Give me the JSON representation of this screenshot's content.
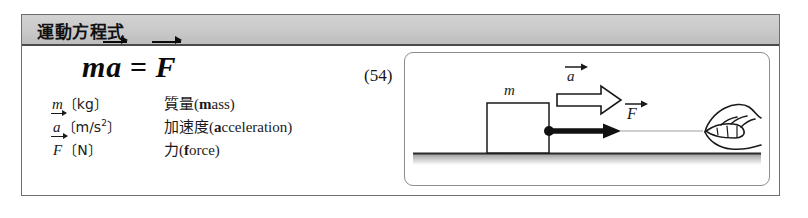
{
  "figure": {
    "title": "運動方程式",
    "equation": {
      "mass_symbol": "m",
      "accel_symbol": "a",
      "equals": "=",
      "force_symbol": "F",
      "number": "(54)"
    },
    "legend": [
      {
        "symbol": "m",
        "symbol_is_vector": false,
        "unit_open": "〔",
        "unit": "kg",
        "unit_exp": "",
        "unit_close": "〕",
        "term_ja": "質量",
        "term_en_bold": "m",
        "term_en_rest": "ass"
      },
      {
        "symbol": "a",
        "symbol_is_vector": true,
        "unit_open": "〔",
        "unit": "m/s",
        "unit_exp": "2",
        "unit_close": "〕",
        "term_ja": "加速度",
        "term_en_bold": "a",
        "term_en_rest": "cceleration"
      },
      {
        "symbol": "F",
        "symbol_is_vector": true,
        "unit_open": "〔",
        "unit": "N",
        "unit_exp": "",
        "unit_close": "〕",
        "term_ja": "力",
        "term_en_bold": "f",
        "term_en_rest": "orce"
      }
    ],
    "illustration": {
      "block_label": "m",
      "accel_label": "a",
      "force_label": "F",
      "description": "A hand pulls a string attached to a block of mass m sliding right along a surface; a hollow arrow marks the acceleration and a solid arrow marks the applied force."
    }
  },
  "colors": {
    "title_bar": "#c9c9c9",
    "frame_border": "#6f6f6f",
    "ink": "#111111",
    "speed_line": "#9a9a9a",
    "ground": "#2b2b2b"
  }
}
